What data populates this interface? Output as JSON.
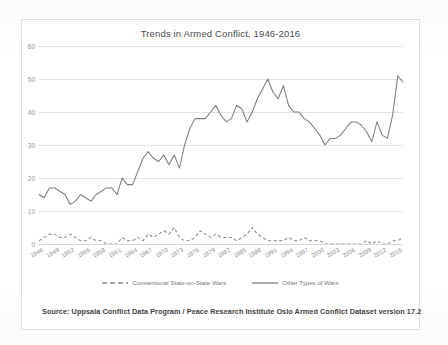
{
  "chart_data": {
    "type": "line",
    "title": "Trends in Armed Conflict, 1946-2016",
    "xlabel": "",
    "ylabel": "",
    "ylim": [
      0,
      60
    ],
    "yticks": [
      0,
      10,
      20,
      30,
      40,
      50,
      60
    ],
    "xlim": [
      1946,
      2016
    ],
    "xticks": [
      1946,
      1949,
      1952,
      1955,
      1958,
      1961,
      1964,
      1967,
      1970,
      1973,
      1976,
      1979,
      1982,
      1985,
      1988,
      1991,
      1994,
      1997,
      2000,
      2003,
      2006,
      2009,
      2012,
      2015
    ],
    "grid": "horizontal",
    "legend_position": "bottom",
    "x": [
      1946,
      1947,
      1948,
      1949,
      1950,
      1951,
      1952,
      1953,
      1954,
      1955,
      1956,
      1957,
      1958,
      1959,
      1960,
      1961,
      1962,
      1963,
      1964,
      1965,
      1966,
      1967,
      1968,
      1969,
      1970,
      1971,
      1972,
      1973,
      1974,
      1975,
      1976,
      1977,
      1978,
      1979,
      1980,
      1981,
      1982,
      1983,
      1984,
      1985,
      1986,
      1987,
      1988,
      1989,
      1990,
      1991,
      1992,
      1993,
      1994,
      1995,
      1996,
      1997,
      1998,
      1999,
      2000,
      2001,
      2002,
      2003,
      2004,
      2005,
      2006,
      2007,
      2008,
      2009,
      2010,
      2011,
      2012,
      2013,
      2014,
      2015,
      2016
    ],
    "series": [
      {
        "name": "Conventional State-on-State Wars",
        "style": "dashed",
        "color": "#8a8a8a",
        "values": [
          1,
          2,
          3,
          3,
          2,
          2,
          3,
          2,
          1,
          1,
          2,
          1,
          1,
          0,
          0,
          0,
          2,
          1,
          1,
          2,
          1,
          3,
          2,
          3,
          4,
          3,
          5,
          2,
          1,
          1,
          2,
          4,
          3,
          2,
          3,
          2,
          2,
          2,
          1,
          2,
          3,
          5,
          3,
          2,
          1,
          1,
          1,
          1,
          2,
          1,
          1,
          2,
          1,
          1,
          1,
          0,
          0,
          0,
          0,
          0,
          0,
          0,
          0,
          1,
          0,
          1,
          0,
          0,
          1,
          1,
          2
        ]
      },
      {
        "name": "Other Types of Wars",
        "style": "solid",
        "color": "#7d7d7d",
        "values": [
          15,
          14,
          17,
          17,
          16,
          15,
          12,
          13,
          15,
          14,
          13,
          15,
          16,
          17,
          17,
          15,
          20,
          18,
          18,
          22,
          26,
          28,
          26,
          25,
          27,
          24,
          27,
          23,
          30,
          35,
          38,
          38,
          38,
          40,
          42,
          39,
          37,
          38,
          42,
          41,
          37,
          40,
          44,
          47,
          50,
          46,
          44,
          48,
          42,
          40,
          40,
          38,
          37,
          35,
          33,
          30,
          32,
          32,
          33,
          35,
          37,
          37,
          36,
          34,
          31,
          37,
          33,
          32,
          39,
          51,
          49
        ]
      }
    ],
    "source_note": "Source: Uppsala Conflict Data Program / Peace Research Institute Oslo Armed Conflict Dataset version 17.2"
  },
  "colors": {
    "frame_border": "#dedede",
    "gridline": "#e2e2e2",
    "tick_text": "#9a9a9a",
    "title_text": "#4a4a4a",
    "source_text": "#3f3f3f",
    "line_solid": "#7d7d7d",
    "line_dashed": "#8a8a8a",
    "page_background": "#fdfdfd"
  }
}
